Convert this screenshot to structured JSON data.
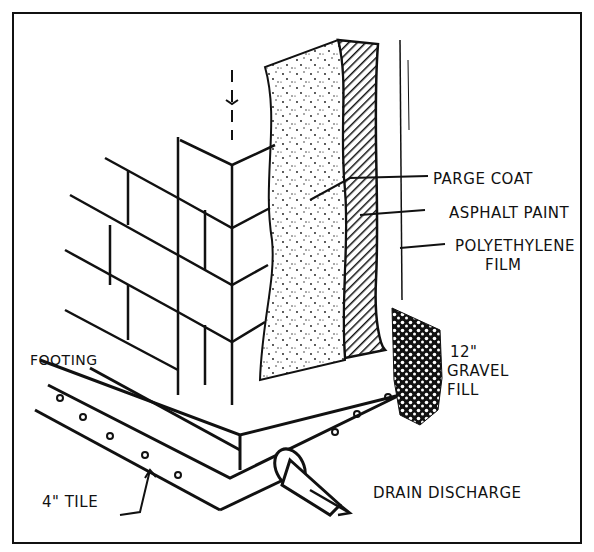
{
  "diagram": {
    "labels": {
      "parge_coat": "PARGE COAT",
      "asphalt_paint": "ASPHALT PAINT",
      "polyethylene_line1": "POLYETHYLENE",
      "polyethylene_line2": "FILM",
      "gravel_line1": "12\"",
      "gravel_line2": "GRAVEL",
      "gravel_line3": "FILL",
      "footing": "FOOTING",
      "tile": "4\" TILE",
      "drain_discharge": "DRAIN DISCHARGE"
    },
    "colors": {
      "ink": "#111111",
      "paper": "#ffffff"
    }
  }
}
